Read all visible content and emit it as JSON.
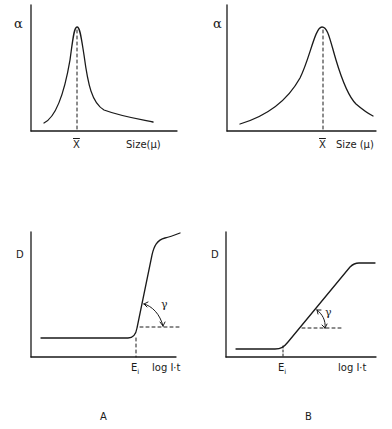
{
  "figure": {
    "panel_labels": {
      "A": "A",
      "B": "B"
    },
    "top_left": {
      "y_label": "α",
      "x_marker": "X",
      "x_label": "Size(μ)",
      "description": "Narrow, sharp size-distribution peak at mean size X̄"
    },
    "top_right": {
      "y_label": "α",
      "x_marker": "X",
      "x_label": "Size (μ)",
      "description": "Broad size-distribution peak at mean size X̄"
    },
    "bottom_left": {
      "y_label": "D",
      "x_marker": "E",
      "x_marker_sub": "i",
      "x_label": "log I·t",
      "angle_label": "γ",
      "description": "Steep characteristic curve (high contrast gamma)"
    },
    "bottom_right": {
      "y_label": "D",
      "x_marker": "E",
      "x_marker_sub": "i",
      "x_label": "log I·t",
      "angle_label": "γ",
      "description": "Gradual characteristic curve (low contrast gamma)"
    }
  },
  "colors": {
    "ink": "#1a1a1a",
    "background": "#ffffff"
  }
}
